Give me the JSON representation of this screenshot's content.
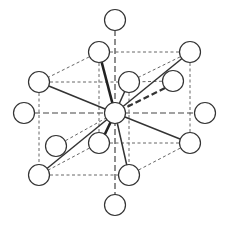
{
  "diagram": {
    "title": "",
    "atom_radius": 10.5,
    "colors": {
      "atom_fill": "#ffffff",
      "atom_stroke": "#333333",
      "line": "#333333"
    },
    "atoms": [
      {
        "id": "top",
        "x": 115,
        "y": 20
      },
      {
        "id": "cube-top-front-left",
        "x": 99,
        "y": 52
      },
      {
        "id": "cube-top-front-right",
        "x": 190,
        "y": 52
      },
      {
        "id": "cube-top-back-left",
        "x": 39,
        "y": 82
      },
      {
        "id": "cube-top-back-mid",
        "x": 129,
        "y": 82
      },
      {
        "id": "inner-right",
        "x": 173,
        "y": 81
      },
      {
        "id": "far-left",
        "x": 24,
        "y": 113
      },
      {
        "id": "center",
        "x": 115,
        "y": 113
      },
      {
        "id": "far-right",
        "x": 205,
        "y": 113
      },
      {
        "id": "inner-left",
        "x": 56,
        "y": 146
      },
      {
        "id": "cube-bottom-front-mid",
        "x": 99,
        "y": 143
      },
      {
        "id": "cube-bottom-front-right",
        "x": 190,
        "y": 143
      },
      {
        "id": "cube-bottom-back-left",
        "x": 39,
        "y": 175
      },
      {
        "id": "cube-bottom-back-mid",
        "x": 129,
        "y": 175
      },
      {
        "id": "bottom",
        "x": 115,
        "y": 205
      }
    ]
  }
}
